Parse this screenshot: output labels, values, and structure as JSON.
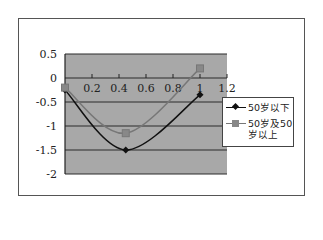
{
  "chart_data": {
    "type": "line",
    "title": "",
    "xlabel": "",
    "ylabel": "",
    "xlim": [
      0,
      1.2
    ],
    "ylim": [
      -2,
      0.5
    ],
    "x_ticks": [
      "0.2",
      "0.4",
      "0.6",
      "0.8",
      "1",
      "1.2"
    ],
    "y_ticks": [
      "0.5",
      "0",
      "-0.5",
      "-1",
      "-1.5",
      "-2"
    ],
    "grid": "horizontal",
    "legend_position": "right",
    "series": [
      {
        "name": "50岁以下",
        "marker": "diamond",
        "color": "#111111",
        "x": [
          0,
          0.45,
          1
        ],
        "values": [
          -0.25,
          -1.5,
          -0.35
        ]
      },
      {
        "name": "50岁及50岁以上",
        "marker": "square",
        "color": "#777777",
        "x": [
          0,
          0.45,
          1
        ],
        "values": [
          -0.2,
          -1.15,
          0.2
        ]
      }
    ]
  },
  "legend": {
    "items": [
      {
        "label_line1": "50岁以下",
        "label_line2": ""
      },
      {
        "label_line1": "50岁及50",
        "label_line2": "岁以上"
      }
    ]
  },
  "colors": {
    "plot_bg": "#a8a8a8",
    "grid": "#2a2a2a",
    "series1": "#111111",
    "series2": "#777777"
  }
}
